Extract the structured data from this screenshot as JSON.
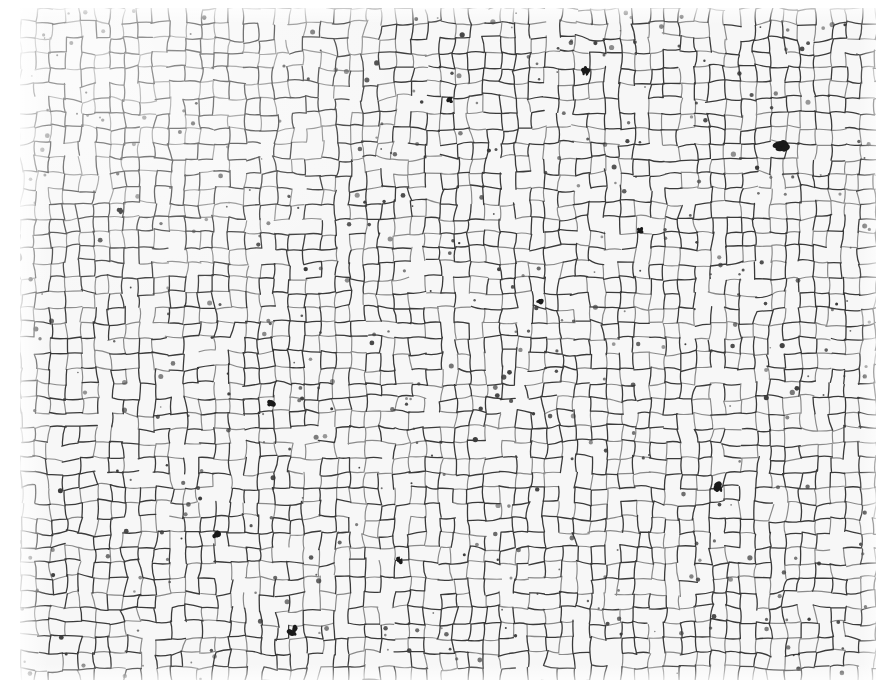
{
  "image": {
    "subject": "optical micrograph of polycrystalline metal grain structure",
    "mode": "grayscale",
    "frame": {
      "width": 888,
      "height": 694,
      "background": "#ffffff"
    },
    "content_region": {
      "x": 20,
      "y": 8,
      "width": 856,
      "height": 672
    },
    "colors": {
      "grain_fill": "#f7f7f7",
      "grain_boundary": "#3a3a3a",
      "dark_phase": "#1a1a1a",
      "light_boundary": "#8a8a8a"
    },
    "texture": {
      "grain_count_estimate": 2200,
      "mean_grain_size_px": 15,
      "boundary_width_px": 1.3,
      "dark_spot_clusters": [
        {
          "x": 15,
          "y": 253,
          "r": 9
        },
        {
          "x": 782,
          "y": 147,
          "r": 8
        },
        {
          "x": 718,
          "y": 487,
          "r": 6
        },
        {
          "x": 293,
          "y": 631,
          "r": 6
        },
        {
          "x": 586,
          "y": 70,
          "r": 5
        },
        {
          "x": 272,
          "y": 404,
          "r": 5
        },
        {
          "x": 215,
          "y": 535,
          "r": 6
        },
        {
          "x": 450,
          "y": 100,
          "r": 4
        },
        {
          "x": 640,
          "y": 230,
          "r": 4
        },
        {
          "x": 120,
          "y": 210,
          "r": 4
        },
        {
          "x": 540,
          "y": 300,
          "r": 4
        },
        {
          "x": 400,
          "y": 560,
          "r": 4
        }
      ]
    },
    "text_labels": []
  }
}
